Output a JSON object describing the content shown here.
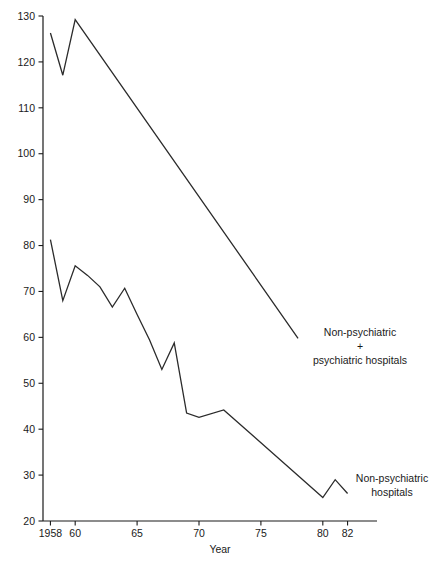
{
  "chart_data": {
    "type": "line",
    "title": "",
    "xlabel": "Year",
    "ylabel": "",
    "xlim": [
      1957.4,
      1982.6
    ],
    "ylim": [
      20,
      130
    ],
    "grid": false,
    "legend_position": "inline-annotations",
    "xticks": [
      1958,
      1960,
      1965,
      1970,
      1975,
      1980,
      1982
    ],
    "xtick_labels": [
      "1958",
      "60",
      "65",
      "70",
      "75",
      "80",
      "82"
    ],
    "yticks": [
      20,
      30,
      40,
      50,
      60,
      70,
      80,
      90,
      100,
      110,
      120,
      130
    ],
    "ytick_labels": [
      "20",
      "30",
      "40",
      "50",
      "60",
      "70",
      "80",
      "90",
      "100",
      "110",
      "120",
      "130"
    ],
    "series": [
      {
        "name": "Non-psychiatric + psychiatric hospitals",
        "x": [
          1958,
          1959,
          1960,
          1978
        ],
        "values": [
          126.3,
          117.1,
          129.2,
          59.8
        ]
      },
      {
        "name": "Non-psychiatric hospitals",
        "x": [
          1958,
          1959,
          1960,
          1961,
          1962,
          1963,
          1964,
          1965,
          1966,
          1967,
          1968,
          1969,
          1970,
          1972,
          1980,
          1981,
          1982
        ],
        "values": [
          81.3,
          68.0,
          75.6,
          73.5,
          71.0,
          66.6,
          70.7,
          65.0,
          59.5,
          53.0,
          58.8,
          43.5,
          42.6,
          44.2,
          25.1,
          29.0,
          26.0
        ]
      }
    ],
    "annotations": [
      {
        "name": "upper-series-label",
        "lines": [
          "Non-psychiatric",
          "+",
          "psychiatric hospitals"
        ],
        "x": 360,
        "y": 336
      },
      {
        "name": "lower-series-label",
        "lines": [
          "Non-psychiatric",
          "hospitals"
        ],
        "x": 392,
        "y": 482
      }
    ]
  }
}
